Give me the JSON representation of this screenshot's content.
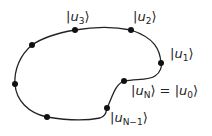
{
  "diagram": {
    "type": "closed-path",
    "stroke_color": "#222222",
    "points": [
      {
        "id": "u0",
        "label": "|uN⟩ = |u0⟩",
        "x": 124,
        "y": 81
      },
      {
        "id": "u1",
        "label": "|u1⟩",
        "x": 161,
        "y": 63
      },
      {
        "id": "u2",
        "label": "|u2⟩",
        "x": 131,
        "y": 30
      },
      {
        "id": "u3",
        "label": "|u3⟩",
        "x": 75,
        "y": 30
      },
      {
        "id": "p4",
        "label": "",
        "x": 32,
        "y": 45
      },
      {
        "id": "p5",
        "label": "",
        "x": 15,
        "y": 84
      },
      {
        "id": "p6",
        "label": "",
        "x": 47,
        "y": 117
      },
      {
        "id": "uN-1",
        "label": "|uN-1⟩",
        "x": 107,
        "y": 108
      }
    ],
    "labels": {
      "u3": {
        "sym": "u",
        "sub": "3"
      },
      "u2": {
        "sym": "u",
        "sub": "2"
      },
      "u1": {
        "sym": "u",
        "sub": "1"
      },
      "uN": {
        "sym": "u",
        "sub": "N"
      },
      "equals": "=",
      "u0": {
        "sym": "u",
        "sub": "0"
      },
      "uNm1": {
        "sym": "u",
        "sub": "N−1"
      }
    }
  }
}
